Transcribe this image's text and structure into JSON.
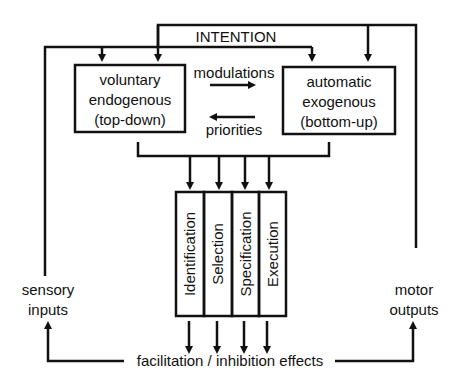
{
  "diagram": {
    "top_label": "INTENTION",
    "boxes": {
      "voluntary": {
        "lines": [
          "voluntary",
          "endogenous",
          "(top-down)"
        ]
      },
      "automatic": {
        "lines": [
          "automatic",
          "exogenous",
          "(bottom-up)"
        ]
      }
    },
    "arrow_labels": {
      "modulations": "modulations",
      "priorities": "priorities"
    },
    "stages": [
      "Identification",
      "Selection",
      "Specification",
      "Execution"
    ],
    "side_labels": {
      "sensory": [
        "sensory",
        "inputs"
      ],
      "motor": [
        "motor",
        "outputs"
      ]
    },
    "bottom_label": "facilitation / inhibition effects"
  }
}
